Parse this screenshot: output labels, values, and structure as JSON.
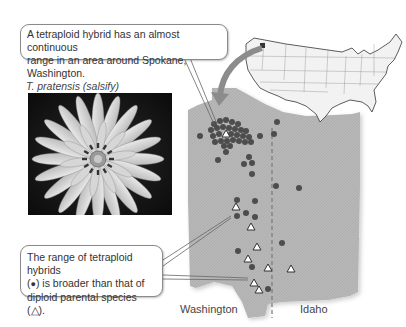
{
  "callouts": {
    "top": {
      "line1": "A tetraploid hybrid has an almost continuous",
      "line2": "range in an area around Spokane, Washington."
    },
    "bottom": {
      "line1": "The range of tetraploid hybrids",
      "line2_pre": "(",
      "line2_symbol": "●",
      "line2_post": ") is broader than that of",
      "line3_pre": "diploid parental species (",
      "line3_symbol": "△",
      "line3_post": ")."
    }
  },
  "photo": {
    "caption": "T. pratensis (salsify)"
  },
  "map": {
    "state_labels": {
      "washington": "Washington",
      "idaho": "Idaho"
    },
    "legend": {
      "hybrid_symbol": "filled circle",
      "diploid_symbol": "open triangle"
    },
    "colors": {
      "region_fill": "#b4b4b4",
      "hybrid_dot": "#4d4d4d",
      "arrow": "#8c8c8c",
      "border_dash": "#7a7a7a"
    },
    "hybrid_points": [
      [
        200,
        136
      ],
      [
        254,
        115
      ],
      [
        277,
        122
      ],
      [
        274,
        134
      ],
      [
        237,
        148
      ],
      [
        218,
        158
      ],
      [
        236,
        153
      ],
      [
        250,
        153
      ],
      [
        238,
        167
      ],
      [
        251,
        163
      ],
      [
        252,
        174
      ],
      [
        277,
        184
      ],
      [
        299,
        188
      ],
      [
        237,
        199
      ],
      [
        255,
        201
      ],
      [
        237,
        215
      ],
      [
        246,
        212
      ],
      [
        255,
        216
      ],
      [
        281,
        243
      ],
      [
        238,
        251
      ],
      [
        253,
        265
      ],
      [
        268,
        288
      ]
    ],
    "diploid_points": [
      [
        226,
        136
      ],
      [
        236,
        206
      ],
      [
        252,
        226
      ],
      [
        257,
        246
      ],
      [
        248,
        258
      ],
      [
        272,
        263
      ],
      [
        291,
        262
      ],
      [
        254,
        281
      ],
      [
        259,
        289
      ]
    ]
  }
}
